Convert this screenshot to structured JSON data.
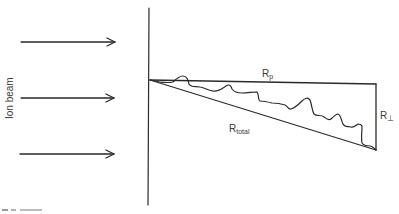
{
  "diagram": {
    "labels": {
      "ion_beam": "Ion beam",
      "r_parallel_main": "R",
      "r_parallel_sub": "p",
      "r_perp_main": "R",
      "r_perp_sub": "⊥",
      "r_total_main": "R",
      "r_total_sub": "total"
    },
    "colors": {
      "line": "#2a2a2a",
      "text": "#3a3a3a",
      "background": "#ffffff"
    },
    "arrows": [
      {
        "x1": 21,
        "x2": 115,
        "y": 42
      },
      {
        "x1": 21,
        "x2": 115,
        "y": 98
      },
      {
        "x1": 21,
        "x2": 115,
        "y": 154
      }
    ],
    "surface_line": {
      "x": 149,
      "y1": 8,
      "y2": 205
    },
    "triangle": {
      "apex": [
        150,
        80
      ],
      "top_right": [
        376,
        84
      ],
      "bottom_right": [
        376,
        150
      ]
    }
  }
}
